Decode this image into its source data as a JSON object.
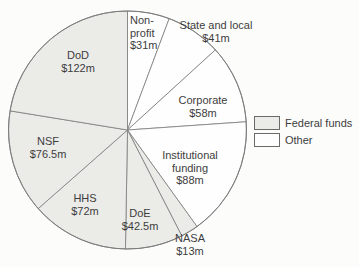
{
  "chart_data": {
    "type": "pie",
    "direction": "clockwise",
    "start_angle_deg": 0,
    "slices": [
      {
        "label": "Non-profit",
        "value": 31,
        "value_label": "$31m",
        "group": "Other",
        "lines": [
          "Non-",
          "profit",
          "$31m"
        ]
      },
      {
        "label": "State and local",
        "value": 41,
        "value_label": "$41m",
        "group": "Other",
        "lines": [
          "State and local",
          "$41m"
        ]
      },
      {
        "label": "Corporate",
        "value": 58,
        "value_label": "$58m",
        "group": "Other",
        "lines": [
          "Corporate",
          "$58m"
        ]
      },
      {
        "label": "Institutional funding",
        "value": 88,
        "value_label": "$88m",
        "group": "Other",
        "lines": [
          "Institutional",
          "funding",
          "$88m"
        ]
      },
      {
        "label": "NASA",
        "value": 13,
        "value_label": "$13m",
        "group": "Federal funds",
        "lines": [
          "NASA",
          "$13m"
        ]
      },
      {
        "label": "DoE",
        "value": 42.5,
        "value_label": "$42.5m",
        "group": "Federal funds",
        "lines": [
          "DoE",
          "$42.5m"
        ]
      },
      {
        "label": "HHS",
        "value": 72,
        "value_label": "$72m",
        "group": "Federal funds",
        "lines": [
          "HHS",
          "$72m"
        ]
      },
      {
        "label": "NSF",
        "value": 76.5,
        "value_label": "$76.5m",
        "group": "Federal funds",
        "lines": [
          "NSF",
          "$76.5m"
        ]
      },
      {
        "label": "DoD",
        "value": 122,
        "value_label": "$122m",
        "group": "Federal funds",
        "lines": [
          "DoD",
          "$122m"
        ]
      }
    ],
    "legend": [
      {
        "label": "Federal funds",
        "color": "#ebebe8"
      },
      {
        "label": "Other",
        "color": "#fefefe"
      }
    ],
    "colors": {
      "outline": "#7c7c7c",
      "text": "#3d3d3d",
      "background": "#fcfcfb"
    }
  }
}
